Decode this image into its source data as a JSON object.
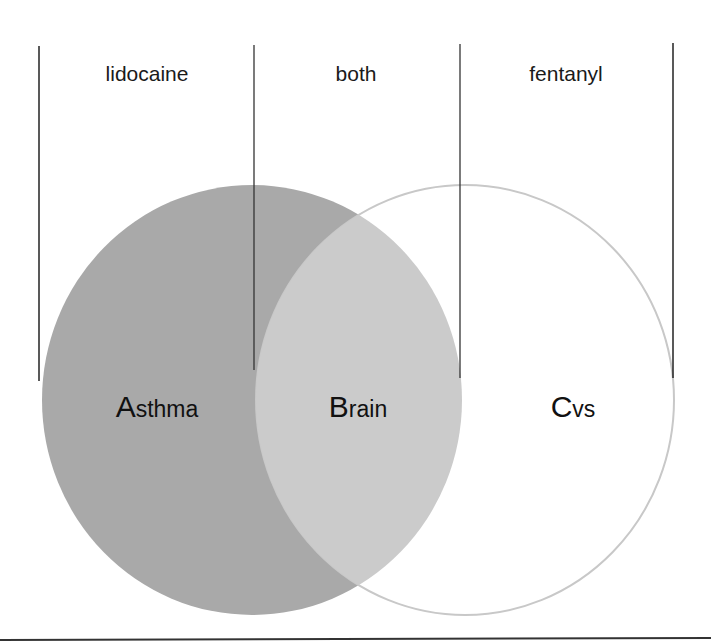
{
  "columns": [
    {
      "label": "lidocaine",
      "center_x": 147
    },
    {
      "label": "both",
      "center_x": 356
    },
    {
      "label": "fentanyl",
      "center_x": 566
    }
  ],
  "sets": [
    {
      "initial": "A",
      "rest": "sthma",
      "center_x": 157
    },
    {
      "initial": "B",
      "rest": "rain",
      "center_x": 358
    },
    {
      "initial": "C",
      "rest": "vs",
      "center_x": 573
    }
  ],
  "colors": {
    "set_a_fill": "#a9a9a9",
    "intersection_fill": "#cbcbcb",
    "set_b_outline": "#c8c8c8",
    "lines": "#222222"
  }
}
